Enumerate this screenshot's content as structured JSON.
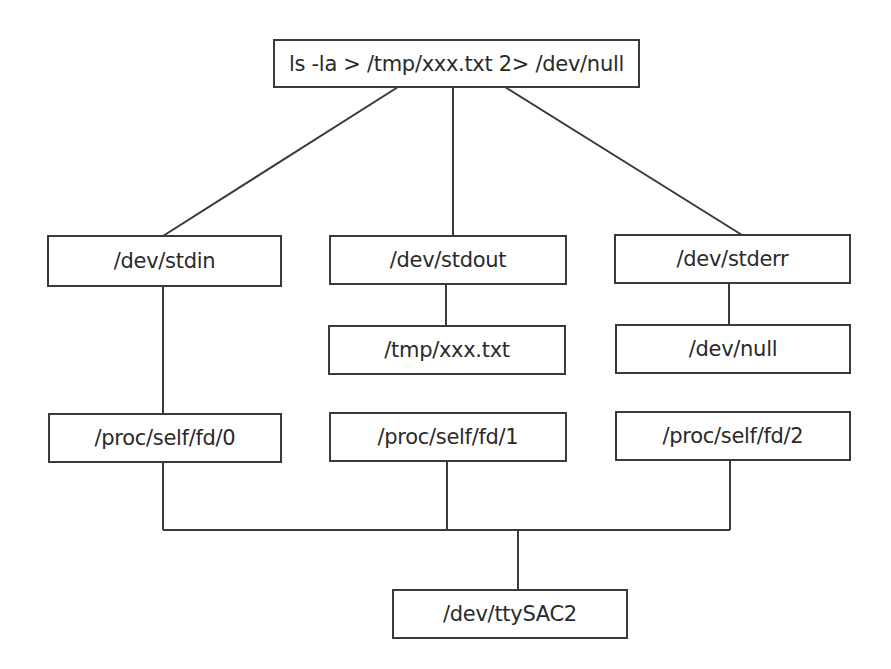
{
  "diagram": {
    "type": "tree",
    "colors": {
      "line": "#3a3a3a",
      "text": "#2a2a2a",
      "background": "#ffffff"
    },
    "nodes": {
      "command": "ls -la > /tmp/xxx.txt 2> /dev/null",
      "stdin": "/dev/stdin",
      "stdout": "/dev/stdout",
      "stderr": "/dev/stderr",
      "stdout_target": "/tmp/xxx.txt",
      "stderr_target": "/dev/null",
      "fd0": "/proc/self/fd/0",
      "fd1": "/proc/self/fd/1",
      "fd2": "/proc/self/fd/2",
      "tty": "/dev/ttySAC2"
    },
    "edges": [
      [
        "command",
        "stdin"
      ],
      [
        "command",
        "stdout"
      ],
      [
        "command",
        "stderr"
      ],
      [
        "stdout",
        "stdout_target"
      ],
      [
        "stderr",
        "stderr_target"
      ],
      [
        "stdin",
        "fd0"
      ],
      [
        "fd0",
        "tty"
      ],
      [
        "fd1",
        "tty"
      ],
      [
        "fd2",
        "tty"
      ]
    ]
  }
}
